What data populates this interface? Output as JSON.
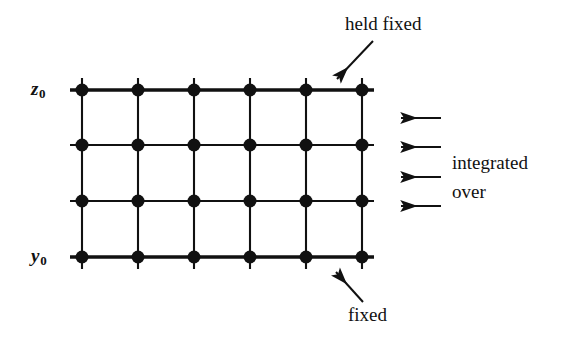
{
  "figure": {
    "background_color": "#ffffff",
    "ink_color": "#111111"
  },
  "labels": {
    "z_axis": {
      "symbol": "z",
      "subscript": "0",
      "text": "z0"
    },
    "y_axis": {
      "symbol": "y",
      "subscript": "0",
      "text": "y0"
    },
    "held_fixed": "held fixed",
    "fixed": "fixed",
    "integrated": "integrated",
    "over": "over"
  },
  "lattice": {
    "columns": 6,
    "rows": 4,
    "column_x": [
      82,
      138,
      194,
      250,
      306,
      362
    ],
    "row_y": [
      90,
      145,
      201,
      257
    ],
    "node_radius": 6.5,
    "stub_length": 12,
    "line_width_normal": 2.1,
    "line_width_bold": 3.4,
    "bold_rows": [
      0,
      3
    ],
    "node_color": "#111111",
    "line_color": "#111111"
  },
  "annotations": {
    "held_fixed_arrow": {
      "name": "held-fixed-arrow",
      "from": {
        "x": 373,
        "y": 41
      },
      "to": {
        "x": 337,
        "y": 79
      }
    },
    "fixed_arrow": {
      "name": "fixed-arrow",
      "from": {
        "x": 363,
        "y": 302
      },
      "to": {
        "x": 336,
        "y": 272
      }
    },
    "integration_arrows": {
      "name": "integration-arrows",
      "count": 4,
      "direction": "left",
      "tail_x": 441,
      "head_x": 401,
      "y_positions": [
        118,
        147,
        177,
        206
      ]
    }
  }
}
